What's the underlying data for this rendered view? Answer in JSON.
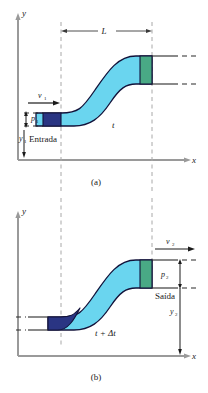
{
  "figure": {
    "panels": [
      {
        "id": "a",
        "caption": "(a)",
        "axes": {
          "y_label": "y",
          "x_label": "x"
        },
        "labels": {
          "length": "L",
          "inlet_velocity": "v",
          "inlet_velocity_sub": "1",
          "inlet_pressure": "p",
          "inlet_pressure_sub": "1",
          "inlet_height": "y",
          "inlet_height_sub": "1",
          "inlet_name": "Entrada",
          "time": "t"
        }
      },
      {
        "id": "b",
        "caption": "(b)",
        "axes": {
          "y_label": "y",
          "x_label": "x"
        },
        "labels": {
          "outlet_velocity": "v",
          "outlet_velocity_sub": "2",
          "outlet_pressure": "p",
          "outlet_pressure_sub": "2",
          "outlet_height": "y",
          "outlet_height_sub": "2",
          "outlet_name": "Saída",
          "time": "t + Δt"
        }
      }
    ],
    "colors": {
      "fluid_cyan": "#6ad5ef",
      "slug_dark_blue": "#2a3583",
      "slug_green": "#49a985",
      "outline": "#12123a",
      "axis_gray": "#9a9a9a",
      "dash_gray": "#9a9a9a",
      "text": "#1a1a1a",
      "background": "#ffffff"
    }
  }
}
